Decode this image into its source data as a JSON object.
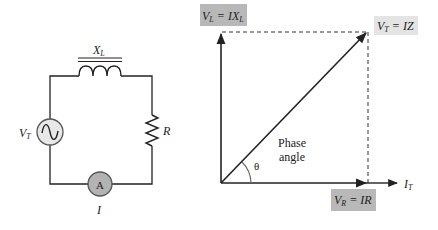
{
  "circuit": {
    "inductor_label": "X",
    "inductor_sub": "L",
    "source_label": "V",
    "source_sub": "T",
    "resistor_label": "R",
    "ammeter_symbol": "A",
    "current_label": "I"
  },
  "phasor": {
    "vl_label": {
      "v": "V",
      "sub": "L",
      "eq": " = IX",
      "eq_sub": "L"
    },
    "vt_label": {
      "v": "V",
      "sub": "T",
      "eq": " = IZ"
    },
    "vr_label": {
      "v": "V",
      "sub": "R",
      "eq": " = IR"
    },
    "it_label": {
      "v": "I",
      "sub": "T"
    },
    "phase_line1": "Phase",
    "phase_line2": "angle",
    "theta": "θ"
  },
  "colors": {
    "line": "#222222",
    "label_box_dark": "#b8b8b8",
    "label_box_light": "#e4e4e4",
    "meter_fill": "#b3b3b3",
    "source_fill": "#e8e8e8"
  }
}
